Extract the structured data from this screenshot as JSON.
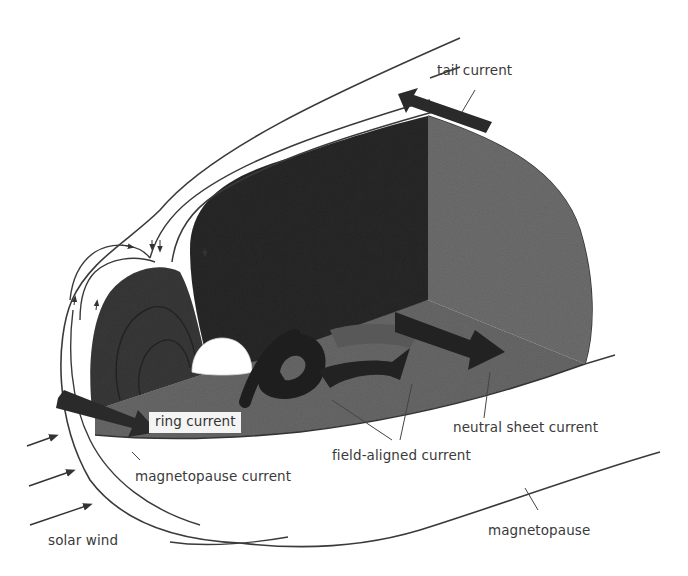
{
  "figure": {
    "labels": {
      "tail_current": "tail current",
      "ring_current": "ring current",
      "magnetopause_current": "magnetopause current",
      "field_aligned_current": "field-aligned current",
      "neutral_sheet_current": "neutral sheet current",
      "magnetopause": "magnetopause",
      "solar_wind": "solar wind"
    },
    "colors": {
      "background": "#ffffff",
      "dark_fill": "#2a2a2a",
      "mid_fill": "#5a5a5a",
      "light_fill": "#7c7c7c",
      "tail_wall": "#6e6e6e",
      "earth": "#ffffff",
      "line": "#3a3a3a",
      "arrow": "#2b2b2b"
    }
  }
}
